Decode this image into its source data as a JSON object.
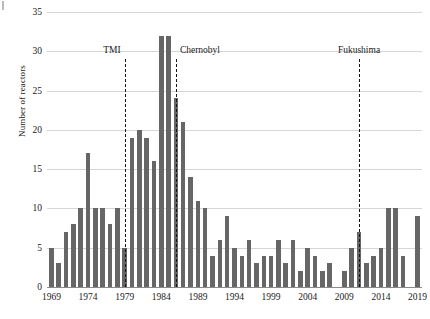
{
  "chart_data": {
    "type": "bar",
    "title": "",
    "subtitle": "",
    "xlabel": "",
    "ylabel": "Number of reactors",
    "ylim": [
      0,
      35
    ],
    "xlim": [
      1968.4,
      2019.6
    ],
    "grid": true,
    "legend": "none",
    "bar_color": "#666666",
    "y_ticks": [
      0,
      5,
      10,
      15,
      20,
      25,
      30,
      35
    ],
    "x_ticks": [
      1969,
      1974,
      1979,
      1984,
      1989,
      1994,
      1999,
      2004,
      2009,
      2014,
      2019
    ],
    "categories": [
      1969,
      1970,
      1971,
      1972,
      1973,
      1974,
      1975,
      1976,
      1977,
      1978,
      1979,
      1980,
      1981,
      1982,
      1983,
      1984,
      1985,
      1986,
      1987,
      1988,
      1989,
      1990,
      1991,
      1992,
      1993,
      1994,
      1995,
      1996,
      1997,
      1998,
      1999,
      2000,
      2001,
      2002,
      2003,
      2004,
      2005,
      2006,
      2007,
      2008,
      2009,
      2010,
      2011,
      2012,
      2013,
      2014,
      2015,
      2016,
      2017,
      2018,
      2019
    ],
    "values": [
      5,
      3,
      7,
      8,
      10,
      17,
      10,
      10,
      8,
      10,
      5,
      19,
      20,
      19,
      16,
      32,
      32,
      24,
      21,
      14,
      11,
      10,
      4,
      6,
      9,
      5,
      4,
      6,
      3,
      4,
      4,
      6,
      3,
      6,
      2,
      5,
      4,
      2,
      3,
      0,
      2,
      5,
      7,
      3,
      4,
      5,
      10,
      10,
      4,
      0,
      9
    ],
    "annotations": [
      {
        "label": "TMI",
        "x": 1979,
        "label_align": "left",
        "label_y": 30.0,
        "line_top": 29.0,
        "line_bottom": 0
      },
      {
        "label": "Chernobyl",
        "x": 1986,
        "label_align": "right",
        "label_y": 30.0,
        "line_top": 29.0,
        "line_bottom": 0
      },
      {
        "label": "Fukushima",
        "x": 2011,
        "label_align": "center",
        "label_y": 30.0,
        "line_top": 29.0,
        "line_bottom": 0
      }
    ]
  }
}
